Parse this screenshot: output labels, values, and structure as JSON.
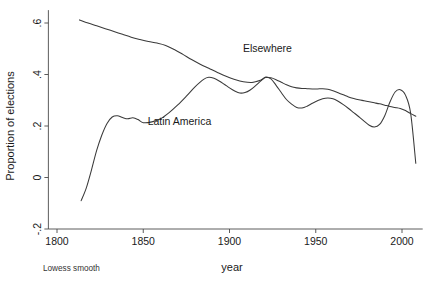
{
  "chart_data": {
    "type": "line",
    "title": "",
    "subtitle": "",
    "xlabel": "year",
    "ylabel": "Proportion of elections",
    "note": "Lowess smooth",
    "xlim": [
      1795,
      2012
    ],
    "ylim": [
      -0.2,
      0.65
    ],
    "xticks": [
      1800,
      1850,
      1900,
      1950,
      2000
    ],
    "xtick_labels": [
      "1800",
      "1850",
      "1900",
      "1950",
      "2000"
    ],
    "yticks": [
      -0.2,
      0,
      0.2,
      0.4,
      0.6
    ],
    "ytick_labels": [
      "-.2",
      "0",
      ".2",
      ".4",
      ".6"
    ],
    "grid": false,
    "legend_position": "inline-annotations",
    "series": [
      {
        "name": "Elsewhere",
        "label": "Elsewhere",
        "label_x": 1922,
        "label_y": 0.487,
        "color": "#3a3a3a",
        "x": [
          1813,
          1818,
          1823,
          1828,
          1833,
          1838,
          1843,
          1848,
          1853,
          1858,
          1863,
          1868,
          1873,
          1878,
          1883,
          1888,
          1893,
          1898,
          1903,
          1908,
          1913,
          1918,
          1921,
          1924,
          1927,
          1930,
          1933,
          1936,
          1939,
          1942,
          1945,
          1948,
          1951,
          1954,
          1957,
          1960,
          1963,
          1966,
          1969,
          1972,
          1975,
          1978,
          1981,
          1984,
          1987,
          1990,
          1993,
          1996,
          1999,
          2002,
          2005,
          2008
        ],
        "y": [
          0.612,
          0.6,
          0.589,
          0.578,
          0.567,
          0.556,
          0.545,
          0.536,
          0.528,
          0.522,
          0.513,
          0.497,
          0.478,
          0.458,
          0.44,
          0.424,
          0.408,
          0.393,
          0.381,
          0.372,
          0.369,
          0.378,
          0.388,
          0.387,
          0.38,
          0.37,
          0.36,
          0.352,
          0.348,
          0.346,
          0.345,
          0.344,
          0.344,
          0.345,
          0.343,
          0.337,
          0.329,
          0.321,
          0.313,
          0.307,
          0.302,
          0.298,
          0.294,
          0.29,
          0.286,
          0.281,
          0.276,
          0.272,
          0.268,
          0.26,
          0.248,
          0.238
        ]
      },
      {
        "name": "Latin America",
        "label": "Latin America",
        "label_x": 1871,
        "label_y": 0.205,
        "color": "#3a3a3a",
        "x": [
          1814,
          1817,
          1820,
          1823,
          1826,
          1829,
          1832,
          1835,
          1838,
          1841,
          1844,
          1847,
          1850,
          1855,
          1860,
          1865,
          1870,
          1875,
          1880,
          1885,
          1888,
          1891,
          1894,
          1897,
          1900,
          1903,
          1906,
          1909,
          1912,
          1915,
          1918,
          1921,
          1924,
          1927,
          1930,
          1933,
          1936,
          1939,
          1942,
          1945,
          1948,
          1951,
          1954,
          1957,
          1960,
          1963,
          1966,
          1969,
          1972,
          1975,
          1978,
          1981,
          1984,
          1987,
          1990,
          1993,
          1996,
          1999,
          2002,
          2005,
          2008
        ],
        "y": [
          -0.09,
          -0.04,
          0.03,
          0.105,
          0.165,
          0.21,
          0.235,
          0.24,
          0.233,
          0.228,
          0.232,
          0.225,
          0.213,
          0.216,
          0.228,
          0.252,
          0.282,
          0.316,
          0.352,
          0.381,
          0.389,
          0.385,
          0.375,
          0.362,
          0.348,
          0.336,
          0.328,
          0.33,
          0.34,
          0.356,
          0.374,
          0.39,
          0.383,
          0.358,
          0.33,
          0.303,
          0.285,
          0.272,
          0.27,
          0.277,
          0.288,
          0.298,
          0.306,
          0.309,
          0.306,
          0.296,
          0.283,
          0.268,
          0.252,
          0.236,
          0.219,
          0.203,
          0.196,
          0.206,
          0.24,
          0.293,
          0.332,
          0.341,
          0.32,
          0.25,
          0.055
        ]
      }
    ]
  }
}
